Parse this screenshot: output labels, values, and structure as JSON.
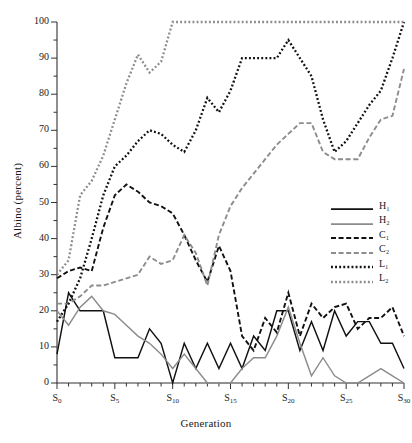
{
  "chart_data": {
    "type": "line",
    "title": "",
    "xlabel": "Generation",
    "ylabel": "Albino (percent)",
    "xlim": [
      0,
      30
    ],
    "ylim": [
      0,
      100
    ],
    "grid": false,
    "legend_position": "right-middle",
    "x_tick_labels": [
      "S0",
      "S5",
      "S10",
      "S15",
      "S20",
      "S25",
      "S30"
    ],
    "x_tick_values": [
      0,
      5,
      10,
      15,
      20,
      25,
      30
    ],
    "x_minor_tick_step": 1,
    "y_tick_labels": [
      "0",
      "10",
      "20",
      "30",
      "40",
      "50",
      "60",
      "70",
      "80",
      "90",
      "100"
    ],
    "y_tick_values": [
      0,
      10,
      20,
      30,
      40,
      50,
      60,
      70,
      80,
      90,
      100
    ],
    "y_minor_tick_step": 5,
    "x": [
      0,
      1,
      2,
      3,
      4,
      5,
      6,
      7,
      8,
      9,
      10,
      11,
      12,
      13,
      14,
      15,
      16,
      17,
      18,
      19,
      20,
      21,
      22,
      23,
      24,
      25,
      26,
      27,
      28,
      29,
      30
    ],
    "series": [
      {
        "name": "H1",
        "label": "H₁",
        "color": "#111111",
        "style": "solid",
        "values": [
          8,
          25,
          20,
          20,
          20,
          7,
          7,
          7,
          15,
          11,
          0,
          11,
          4,
          11,
          4,
          11,
          4,
          13,
          9,
          20,
          20,
          9,
          17,
          9,
          20,
          13,
          17,
          17,
          11,
          11,
          4
        ]
      },
      {
        "name": "H2",
        "label": "H₂",
        "color": "#8c8c8c",
        "style": "solid",
        "values": [
          20,
          16,
          21,
          24,
          20,
          19,
          16,
          13,
          11,
          8,
          4,
          8,
          4,
          0,
          0,
          0,
          4,
          7,
          7,
          13,
          21,
          11,
          2,
          7,
          2,
          0,
          0,
          2,
          4,
          2,
          0
        ]
      },
      {
        "name": "C1",
        "label": "C₁",
        "color": "#111111",
        "style": "dashed",
        "values": [
          29,
          31,
          32,
          31,
          43,
          52,
          55,
          53,
          50,
          49,
          47,
          41,
          34,
          28,
          38,
          31,
          13,
          9,
          18,
          14,
          25,
          13,
          22,
          18,
          21,
          22,
          15,
          18,
          18,
          21,
          13
        ]
      },
      {
        "name": "C2",
        "label": "C₂",
        "color": "#8c8c8c",
        "style": "dashed",
        "values": [
          22,
          22,
          24,
          27,
          27,
          28,
          29,
          30,
          35,
          33,
          34,
          41,
          36,
          27,
          41,
          49,
          54,
          58,
          62,
          66,
          69,
          72,
          72,
          64,
          62,
          62,
          62,
          68,
          73,
          74,
          87
        ]
      },
      {
        "name": "L1",
        "label": "L₁",
        "color": "#111111",
        "style": "dotted",
        "values": [
          17,
          22,
          29,
          40,
          52,
          60,
          63,
          67,
          70,
          69,
          66,
          64,
          70,
          79,
          75,
          81,
          90,
          90,
          90,
          90,
          95,
          90,
          85,
          73,
          64,
          67,
          72,
          77,
          81,
          90,
          100
        ]
      },
      {
        "name": "L2",
        "label": "L₂",
        "color": "#8c8c8c",
        "style": "dotted",
        "values": [
          30,
          34,
          52,
          56,
          63,
          73,
          83,
          91,
          86,
          89,
          100,
          100,
          100,
          100,
          100,
          100,
          100,
          100,
          100,
          100,
          100,
          100,
          100,
          100,
          100,
          100,
          100,
          100,
          100,
          100,
          100
        ]
      }
    ]
  },
  "legend": {
    "items": [
      {
        "label": "H₁"
      },
      {
        "label": "H₂"
      },
      {
        "label": "C₁"
      },
      {
        "label": "C₂"
      },
      {
        "label": "L₁"
      },
      {
        "label": "L₂"
      }
    ]
  }
}
